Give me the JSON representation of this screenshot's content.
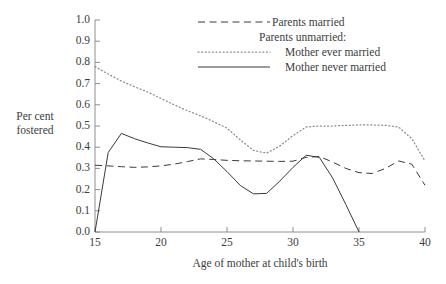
{
  "axes": {
    "y_title_line1": "Per cent",
    "y_title_line2": "fostered",
    "x_title": "Age of mother at child's birth",
    "y_ticks": [
      "0.0",
      "0.1",
      "0.2",
      "0.3",
      "0.4",
      "0.5",
      "0.6",
      "0.7",
      "0.8",
      "0.9",
      "1.0"
    ],
    "x_ticks": [
      "15",
      "20",
      "25",
      "30",
      "35",
      "40"
    ]
  },
  "legend": {
    "items": [
      {
        "label": "Parents married",
        "style": "dashed",
        "indent": false,
        "has_key": true
      },
      {
        "label": "Parents unmarried:",
        "style": "none",
        "indent": false,
        "has_key": false
      },
      {
        "label": "Mother ever married",
        "style": "dotted",
        "indent": true,
        "has_key": true
      },
      {
        "label": "Mother never married",
        "style": "solid",
        "indent": true,
        "has_key": true
      }
    ]
  },
  "colors": {
    "line": "#3a3a3a",
    "dotted": "#8a8a8a",
    "axis": "#8e8e8e",
    "background": "#ffffff",
    "text": "#3c3c3c"
  },
  "chart_data": {
    "type": "line",
    "title": "",
    "xlabel": "Age of mother at child's birth",
    "ylabel": "Per cent fostered",
    "xlim": [
      15,
      40
    ],
    "ylim": [
      0.0,
      1.0
    ],
    "grid": false,
    "legend_position": "top-right",
    "x": [
      15,
      16,
      17,
      18,
      19,
      20,
      21,
      22,
      23,
      24,
      25,
      26,
      27,
      28,
      29,
      30,
      31,
      32,
      33,
      34,
      35,
      36,
      37,
      38,
      39,
      40
    ],
    "series": [
      {
        "name": "Parents married",
        "style": "dashed",
        "values": [
          0.315,
          0.312,
          0.308,
          0.305,
          0.307,
          0.312,
          0.32,
          0.332,
          0.345,
          0.342,
          0.338,
          0.336,
          0.335,
          0.334,
          0.333,
          0.334,
          0.352,
          0.356,
          0.33,
          0.3,
          0.28,
          0.276,
          0.3,
          0.335,
          0.32,
          0.22
        ]
      },
      {
        "name": "Mother ever married",
        "style": "dotted",
        "values": [
          0.78,
          0.745,
          0.712,
          0.685,
          0.66,
          0.63,
          0.6,
          0.572,
          0.548,
          0.52,
          0.49,
          0.435,
          0.385,
          0.372,
          0.405,
          0.455,
          0.495,
          0.5,
          0.5,
          0.503,
          0.505,
          0.505,
          0.503,
          0.495,
          0.44,
          0.335
        ]
      },
      {
        "name": "Mother never married",
        "style": "solid",
        "values": [
          0.0,
          0.375,
          0.465,
          0.44,
          0.42,
          0.402,
          0.4,
          0.398,
          0.39,
          0.345,
          0.285,
          0.22,
          0.18,
          0.182,
          0.24,
          0.305,
          0.362,
          0.352,
          0.255,
          0.13,
          0.0,
          null,
          null,
          null,
          null,
          null
        ]
      }
    ]
  }
}
